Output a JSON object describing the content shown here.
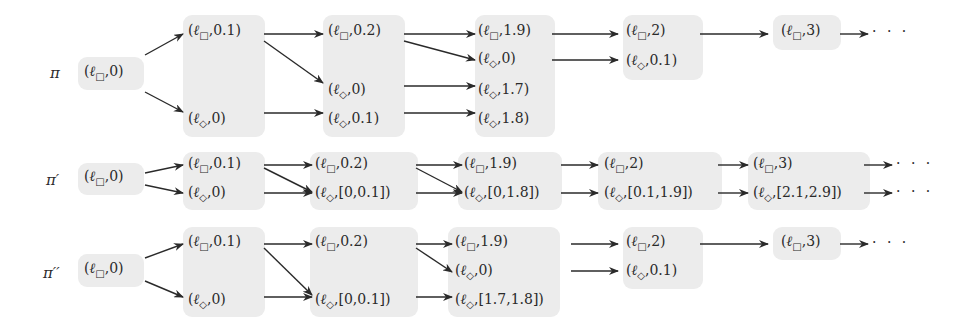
{
  "rows": [
    {
      "label": "π",
      "nodes": {
        "r0": "(ℓ□,0)",
        "a1": "(ℓ□,0.1)",
        "a2": "(ℓ◇,0)",
        "b1": "(ℓ□,0.2)",
        "b2": "(ℓ◇,0)",
        "b3": "(ℓ◇,0.1)",
        "c1": "(ℓ□,1.9)",
        "c2": "(ℓ◇,0)",
        "c3": "(ℓ◇,1.7)",
        "c4": "(ℓ◇,1.8)",
        "d1": "(ℓ□,2)",
        "d2": "(ℓ◇,0.1)",
        "e1": "(ℓ□,3)"
      },
      "continuation": "· · ·"
    },
    {
      "label": "π′",
      "nodes": {
        "r0": "(ℓ□,0)",
        "a1": "(ℓ□,0.1)",
        "a2": "(ℓ◇,0)",
        "b1": "(ℓ□,0.2)",
        "b2": "(ℓ◇,[0,0.1])",
        "c1": "(ℓ□,1.9)",
        "c2": "(ℓ◇,[0,1.8])",
        "d1": "(ℓ□,2)",
        "d2": "(ℓ◇,[0.1,1.9])",
        "e1": "(ℓ□,3)",
        "e2": "(ℓ◇,[2.1,2.9])"
      },
      "continuation": "· · ·"
    },
    {
      "label": "π′′",
      "nodes": {
        "r0": "(ℓ□,0)",
        "a1": "(ℓ□,0.1)",
        "a2": "(ℓ◇,0)",
        "b1": "(ℓ□,0.2)",
        "b2": "(ℓ◇,[0,0.1])",
        "c1": "(ℓ□,1.9)",
        "c2": "(ℓ◇,0)",
        "c3": "(ℓ◇,[1.7,1.8])",
        "d1": "(ℓ□,2)",
        "d2": "(ℓ◇,0.1)",
        "e1": "(ℓ□,3)"
      },
      "continuation": "· · ·"
    }
  ],
  "colors": {
    "box": "#ececec",
    "ink": "#2a2a2a"
  }
}
